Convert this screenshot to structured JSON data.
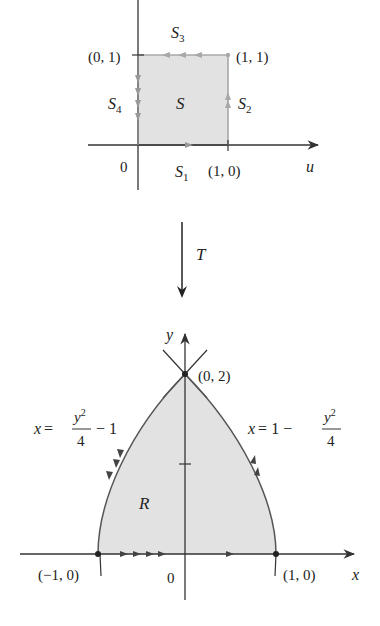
{
  "top_figure": {
    "axis_label": "u",
    "region_label": "S",
    "origin_label": "0",
    "corners": {
      "top_left": "(0, 1)",
      "top_right": "(1, 1)",
      "bottom_right": "(1, 0)"
    },
    "sides": [
      {
        "name": "S",
        "sub": "1"
      },
      {
        "name": "S",
        "sub": "2"
      },
      {
        "name": "S",
        "sub": "3"
      },
      {
        "name": "S",
        "sub": "4"
      }
    ],
    "colors": {
      "fill": "#e2e2e2",
      "edge": "#a8a8a8",
      "axis": "#333333"
    }
  },
  "transform": {
    "label": "T"
  },
  "bottom_figure": {
    "x_axis_label": "x",
    "y_axis_label": "y",
    "region_label": "R",
    "origin_label": "0",
    "points": {
      "top": "(0, 2)",
      "left": "(−1, 0)",
      "right": "(1, 0)"
    },
    "left_curve": {
      "lhs": "x =",
      "num": "y",
      "sup": "2",
      "den": "4",
      "tail": "− 1"
    },
    "right_curve": {
      "lhs": "x = 1 −",
      "num": "y",
      "sup": "2",
      "den": "4"
    },
    "colors": {
      "fill": "#e2e2e2",
      "edge": "#555555",
      "axis": "#333333"
    }
  }
}
